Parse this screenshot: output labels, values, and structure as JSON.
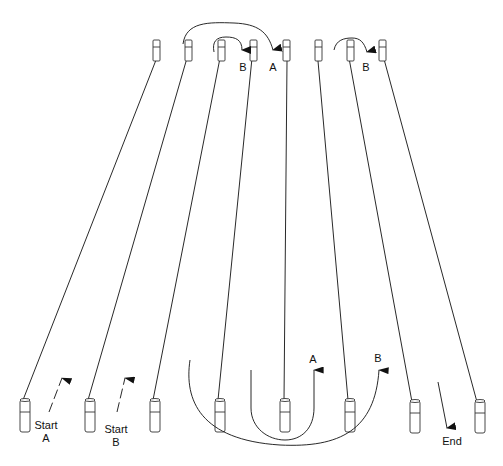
{
  "diagram": {
    "top_tubes": [
      {
        "id": "top-1",
        "x": 157
      },
      {
        "id": "top-2",
        "x": 188
      },
      {
        "id": "top-3",
        "x": 222
      },
      {
        "id": "top-4",
        "x": 254
      },
      {
        "id": "top-5",
        "x": 287
      },
      {
        "id": "top-6",
        "x": 318
      },
      {
        "id": "top-7",
        "x": 350
      },
      {
        "id": "top-8",
        "x": 383
      }
    ],
    "bottom_tubes": [
      {
        "id": "bottom-1",
        "x": 25
      },
      {
        "id": "bottom-2",
        "x": 90
      },
      {
        "id": "bottom-3",
        "x": 155
      },
      {
        "id": "bottom-4",
        "x": 220
      },
      {
        "id": "bottom-5",
        "x": 285
      },
      {
        "id": "bottom-6",
        "x": 350
      },
      {
        "id": "bottom-7",
        "x": 415
      },
      {
        "id": "bottom-8",
        "x": 480
      }
    ],
    "labels": {
      "top_b1": "B",
      "top_a": "A",
      "top_b2": "B",
      "bottom_a": "A",
      "bottom_b": "B",
      "start_a_line1": "Start",
      "start_a_line2": "A",
      "start_b_line1": "Start",
      "start_b_line2": "B",
      "end": "End"
    },
    "colors": {
      "stroke": "#111111",
      "tube_fill": "#ffffff",
      "background": "#ffffff"
    }
  }
}
